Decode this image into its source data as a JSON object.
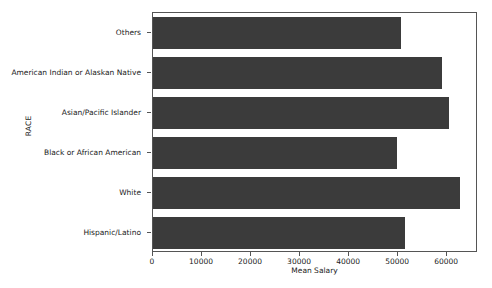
{
  "chart_data": {
    "type": "bar",
    "orientation": "horizontal",
    "title": "",
    "xlabel": "Mean Salary",
    "ylabel": "RACE",
    "categories": [
      "Others",
      "American Indian or Alaskan Native",
      "Asian/Pacific Islander",
      "Black or African American",
      "White",
      "Hispanic/Latino"
    ],
    "values": [
      50600,
      59000,
      60400,
      49800,
      62650,
      51400
    ],
    "xticks": [
      0,
      10000,
      20000,
      30000,
      40000,
      50000,
      60000
    ],
    "xtick_labels": [
      "0",
      "10000",
      "20000",
      "30000",
      "40000",
      "50000",
      "60000"
    ],
    "xlim": [
      0,
      66300
    ],
    "grid": false,
    "legend": null,
    "bar_color": "#3b3b3b",
    "axis_color": "#555555",
    "background_color": "#ffffff"
  }
}
